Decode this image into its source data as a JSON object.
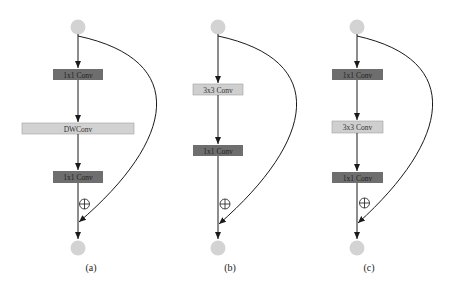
{
  "diagram": {
    "colors": {
      "node_fill": "#d3d3d3",
      "dark_box": "#6e6e6e",
      "dark_box_text": "#2a2a2a",
      "light_box": "#cfcfcf",
      "light_box_border": "#9a9a9a",
      "edge": "#1a1a1a"
    },
    "panels": [
      {
        "caption": "(a)",
        "blocks": [
          {
            "label": "1x1 Conv",
            "style": "dark"
          },
          {
            "label": "DWConv",
            "style": "light"
          },
          {
            "label": "1x1 Conv",
            "style": "dark"
          }
        ],
        "add_symbol": "⊕"
      },
      {
        "caption": "(b)",
        "blocks": [
          {
            "label": "3x3 Conv",
            "style": "light"
          },
          {
            "label": "1x1 Conv",
            "style": "dark"
          }
        ],
        "add_symbol": "⊕"
      },
      {
        "caption": "(c)",
        "blocks": [
          {
            "label": "1x1 Conv",
            "style": "dark"
          },
          {
            "label": "3x3 Conv",
            "style": "light"
          },
          {
            "label": "1x1 Conv",
            "style": "dark"
          }
        ],
        "add_symbol": "⊕"
      }
    ]
  }
}
